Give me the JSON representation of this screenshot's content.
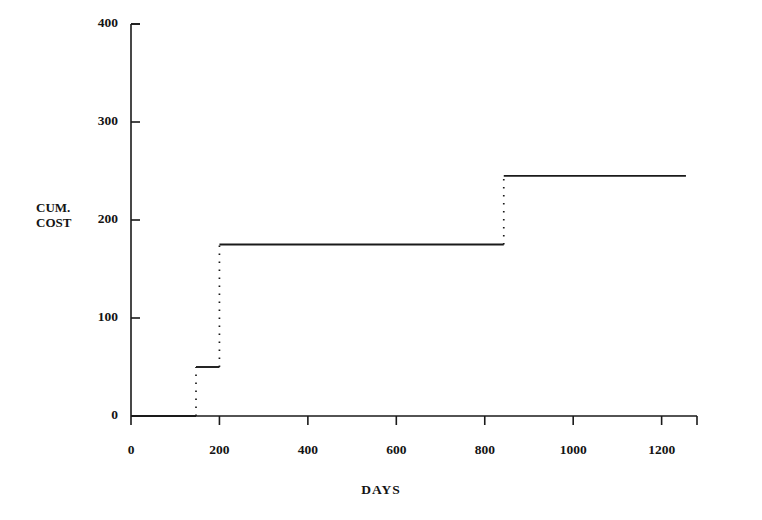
{
  "chart_data": {
    "type": "line",
    "subtype": "step",
    "title": "",
    "xlabel": "DAYS",
    "ylabel": "CUM. COST",
    "ylabel_lines": [
      "CUM.",
      "COST"
    ],
    "xlim": [
      0,
      1280
    ],
    "ylim": [
      0,
      400
    ],
    "xticks": [
      0,
      200,
      400,
      600,
      800,
      1000,
      1200
    ],
    "xtick_labels": [
      "0",
      "200",
      "400",
      "600",
      "800",
      "1000",
      "1200"
    ],
    "yticks": [
      0,
      100,
      200,
      300,
      400
    ],
    "ytick_labels": [
      "0",
      "100",
      "200",
      "300",
      "400"
    ],
    "grid": false,
    "legend": false,
    "line_color": "#1a1a1a",
    "riser_style": "dotted",
    "tread_style": "solid",
    "x": [
      0,
      147,
      147,
      200,
      200,
      843,
      843,
      1255
    ],
    "y": [
      0,
      0,
      50,
      50,
      175,
      175,
      245,
      245
    ],
    "steps": [
      {
        "day": 0,
        "cum_cost": 0
      },
      {
        "day": 147,
        "cum_cost": 50
      },
      {
        "day": 200,
        "cum_cost": 175
      },
      {
        "day": 843,
        "cum_cost": 245
      }
    ],
    "series": [
      {
        "name": "CUM. COST",
        "points": [
          {
            "x": 0,
            "y": 0
          },
          {
            "x": 147,
            "y": 0
          },
          {
            "x": 147,
            "y": 50
          },
          {
            "x": 200,
            "y": 50
          },
          {
            "x": 200,
            "y": 175
          },
          {
            "x": 843,
            "y": 175
          },
          {
            "x": 843,
            "y": 245
          },
          {
            "x": 1255,
            "y": 245
          }
        ]
      }
    ]
  }
}
